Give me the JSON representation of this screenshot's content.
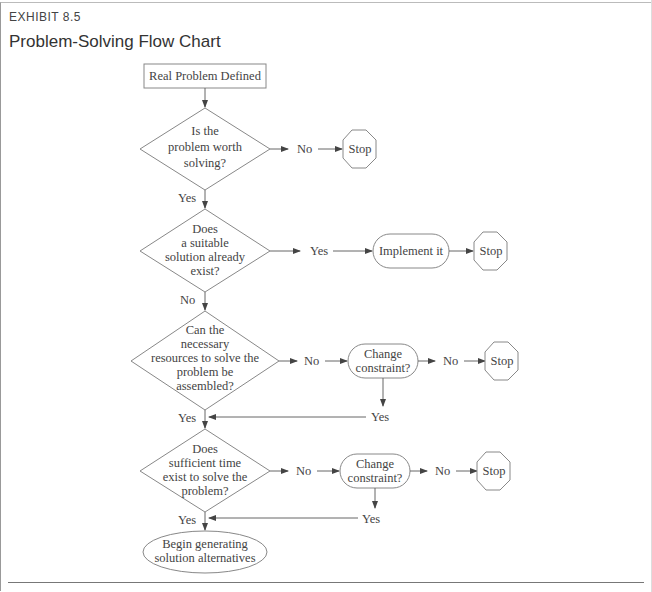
{
  "header": {
    "exhibit_label": "EXHIBIT 8.5",
    "title": "Problem-Solving Flow Chart"
  },
  "flowchart": {
    "start": {
      "label": "Real Problem Defined"
    },
    "decisions": [
      {
        "lines": [
          "Is the",
          "problem worth",
          "solving?"
        ],
        "yes_label": "Yes",
        "no_label": "No"
      },
      {
        "lines": [
          "Does",
          "a suitable",
          "solution already",
          "exist?"
        ],
        "yes_label": "Yes",
        "no_label": "No"
      },
      {
        "lines": [
          "Can the",
          "necessary",
          "resources to solve the",
          "problem be",
          "assembled?"
        ],
        "yes_label": "Yes",
        "no_label": "No"
      },
      {
        "lines": [
          "Does",
          "sufficient time",
          "exist to solve the",
          "problem?"
        ],
        "yes_label": "Yes",
        "no_label": "No"
      }
    ],
    "implement": {
      "label": "Implement it"
    },
    "change_constraint_1": {
      "lines": [
        "Change",
        "constraint?"
      ],
      "yes_label": "Yes",
      "no_label": "No"
    },
    "change_constraint_2": {
      "lines": [
        "Change",
        "constraint?"
      ],
      "yes_label": "Yes",
      "no_label": "No"
    },
    "stops": [
      {
        "label": "Stop"
      },
      {
        "label": "Stop"
      },
      {
        "label": "Stop"
      },
      {
        "label": "Stop"
      }
    ],
    "end": {
      "lines": [
        "Begin generating",
        "solution alternatives"
      ]
    }
  }
}
